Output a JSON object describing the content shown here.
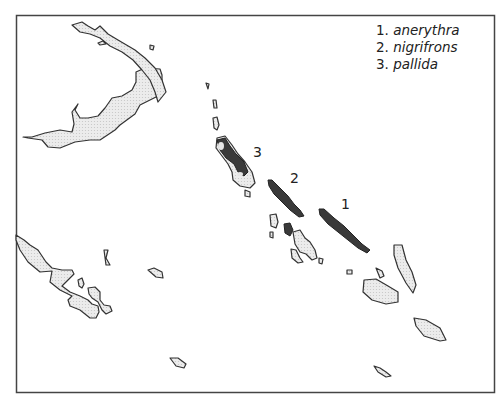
{
  "legend": {
    "items": [
      {
        "num": "1.",
        "name": "anerythra"
      },
      {
        "num": "2.",
        "name": "nigrifrons"
      },
      {
        "num": "3.",
        "name": "pallida"
      }
    ]
  },
  "map_labels": [
    {
      "text": "1",
      "x": 341,
      "y": 196
    },
    {
      "text": "2",
      "x": 290,
      "y": 170
    },
    {
      "text": "3",
      "x": 253,
      "y": 144
    }
  ],
  "colors": {
    "land_fill": "#e6e6e6",
    "land_stroke": "#333333",
    "range_fill": "#3a3a3a",
    "frame": "#444444"
  }
}
